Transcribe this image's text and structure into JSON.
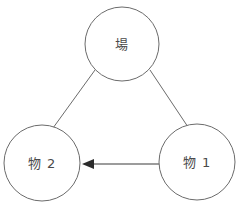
{
  "diagram": {
    "type": "su-field-triangle",
    "background_color": "#ffffff",
    "stroke_color": "#6b6b6b",
    "arrow_color": "#2b2b2b",
    "text_color": "#4a4a4a",
    "nodes": [
      {
        "id": "field",
        "label": "場",
        "cx": 122,
        "cy": 44,
        "r": 37,
        "position": "top"
      },
      {
        "id": "substance-2",
        "label": "物 2",
        "cx": 42,
        "cy": 163,
        "r": 38,
        "position": "bottom-left"
      },
      {
        "id": "substance-1",
        "label": "物 1",
        "cx": 197,
        "cy": 162,
        "r": 38,
        "position": "bottom-right"
      }
    ],
    "edges": [
      {
        "id": "edge-field-substance2",
        "from": "field",
        "to": "substance-2",
        "style": "plain-line",
        "arrow": "none",
        "x1": 95,
        "y1": 70,
        "x2": 53,
        "y2": 128
      },
      {
        "id": "edge-field-substance1",
        "from": "field",
        "to": "substance-1",
        "style": "plain-line",
        "arrow": "none",
        "x1": 150,
        "y1": 70,
        "x2": 188,
        "y2": 127
      },
      {
        "id": "edge-substance1-substance2",
        "from": "substance-1",
        "to": "substance-2",
        "style": "solid-arrow",
        "arrow": "to-substance-2",
        "direction": "leftward",
        "x1": 159,
        "y1": 164,
        "x2": 84,
        "y2": 164
      }
    ]
  }
}
